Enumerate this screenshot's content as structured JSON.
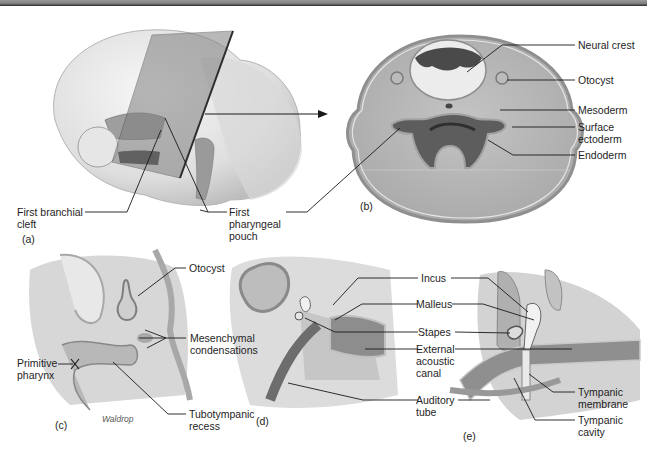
{
  "figure": {
    "panels": [
      {
        "id": "a",
        "tag": "(a)",
        "labels": {
          "first_branchial_cleft": "First branchial cleft",
          "first_pharyngeal_pouch": "First pharyngeal pouch"
        }
      },
      {
        "id": "b",
        "tag": "(b)",
        "labels": {
          "neural_crest": "Neural crest",
          "otocyst": "Otocyst",
          "mesoderm": "Mesoderm",
          "surface_ectoderm": "Surface ectoderm",
          "endoderm": "Endoderm"
        }
      },
      {
        "id": "c",
        "tag": "(c)",
        "credit": "Waldrop",
        "labels": {
          "otocyst": "Otocyst",
          "mesenchymal_condensations": "Mesenchymal condensations",
          "primitive_pharynx": "Primitive pharynx",
          "tubotympanic_recess": "Tubotympanic recess"
        }
      },
      {
        "id": "d",
        "tag": "(d)",
        "labels": {
          "incus": "Incus",
          "malleus": "Malleus",
          "stapes": "Stapes",
          "external_acoustic_canal": "External acoustic canal",
          "auditory_tube": "Auditory tube"
        }
      },
      {
        "id": "e",
        "tag": "(e)",
        "labels": {
          "tympanic_membrane": "Tympanic membrane",
          "tympanic_cavity": "Tympanic cavity"
        }
      }
    ]
  },
  "colors": {
    "tissue_light": "#e4e4e4",
    "tissue_mid": "#c9c9c9",
    "tissue_dark": "#8e8e8e",
    "cavity_dark": "#4a4a4a",
    "leader_line": "#1a1a1a"
  }
}
